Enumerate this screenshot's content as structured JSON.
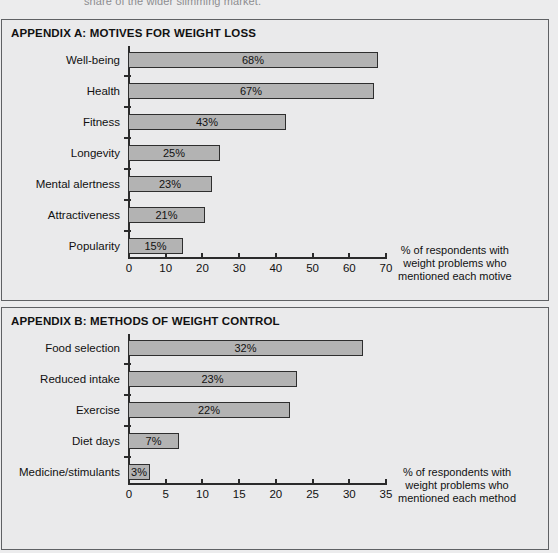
{
  "page": {
    "bleed_top_text": "share of the wider slimming market."
  },
  "panels": [
    {
      "id": "a",
      "title": "APPENDIX A: MOTIVES FOR WEIGHT LOSS",
      "caption_lines": [
        "% of respondents with",
        "weight problems who",
        "mentioned each motive"
      ]
    },
    {
      "id": "b",
      "title": "APPENDIX B: METHODS OF WEIGHT CONTROL",
      "caption_lines": [
        "% of respondents with",
        "weight problems who",
        "mentioned each method"
      ]
    }
  ],
  "chart_data": [
    {
      "type": "bar",
      "orientation": "horizontal",
      "title": "APPENDIX A: MOTIVES FOR WEIGHT LOSS",
      "xlabel": "% of respondents with weight problems who mentioned each motive",
      "ylabel": "",
      "xlim": [
        0,
        70
      ],
      "xticks": [
        0,
        10,
        20,
        30,
        40,
        50,
        60,
        70
      ],
      "xtick_labels": [
        "0",
        "10",
        "20",
        "30",
        "40",
        "50",
        "60",
        "70"
      ],
      "grid": false,
      "legend": false,
      "categories": [
        "Well-being",
        "Health",
        "Fitness",
        "Longevity",
        "Mental alertness",
        "Attractiveness",
        "Popularity"
      ],
      "values": [
        68,
        67,
        43,
        25,
        23,
        21,
        15
      ],
      "data_labels": [
        "68%",
        "67%",
        "43%",
        "25%",
        "23%",
        "21%",
        "15%"
      ]
    },
    {
      "type": "bar",
      "orientation": "horizontal",
      "title": "APPENDIX B: METHODS OF WEIGHT CONTROL",
      "xlabel": "% of respondents with weight problems who mentioned each method",
      "ylabel": "",
      "xlim": [
        0,
        35
      ],
      "xticks": [
        0,
        5,
        10,
        15,
        20,
        25,
        30,
        35
      ],
      "xtick_labels": [
        "0",
        "5",
        "10",
        "15",
        "20",
        "25",
        "30",
        "35"
      ],
      "grid": false,
      "legend": false,
      "categories": [
        "Food selection",
        "Reduced intake",
        "Exercise",
        "Diet days",
        "Medicine/stimulants"
      ],
      "values": [
        32,
        23,
        22,
        7,
        3
      ],
      "data_labels": [
        "32%",
        "23%",
        "22%",
        "7%",
        "3%"
      ]
    }
  ],
  "style": {
    "bar_fill": "#b3b3b3",
    "bar_stroke": "#2e2e2e",
    "axis_color": "#2b2b2b",
    "panel_bg": "#eaeaeb",
    "panel_border": "#5f6164",
    "page_bg": "#ececed",
    "text_color": "#111111"
  }
}
